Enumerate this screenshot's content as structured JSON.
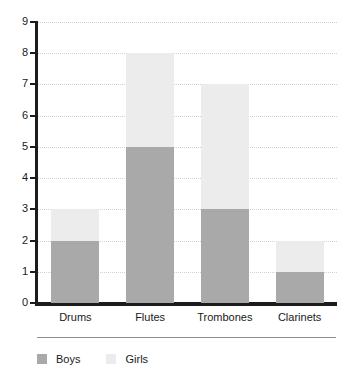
{
  "chart_data": {
    "type": "bar",
    "subtype": "stacked-vertical",
    "title": "",
    "xlabel": "",
    "ylabel": "",
    "categories": [
      "Drums",
      "Flutes",
      "Trombones",
      "Clarinets"
    ],
    "series": [
      {
        "name": "Boys",
        "values": [
          2,
          5,
          3,
          1
        ],
        "color": "#a9a9a9"
      },
      {
        "name": "Girls",
        "values": [
          1,
          3,
          4,
          1
        ],
        "color": "#ececec"
      }
    ],
    "totals": [
      3,
      8,
      7,
      2
    ],
    "ylim": [
      0,
      9
    ],
    "ytick_step": 1,
    "yticks": [
      0,
      1,
      2,
      3,
      4,
      5,
      6,
      7,
      8,
      9
    ],
    "ytick_labels": [
      "0",
      "1",
      "2",
      "3",
      "4",
      "5",
      "6",
      "7",
      "8",
      "9"
    ],
    "grid": true,
    "grid_axis": "y",
    "grid_style": "dotted",
    "grid_color": "#d2d2d2",
    "legend": true,
    "legend_position": "bottom-left",
    "axis_color": "#1c1c1c",
    "background": "#ffffff"
  },
  "legend_entries": [
    {
      "label": "Boys",
      "color": "#a9a9a9"
    },
    {
      "label": "Girls",
      "color": "#ececec"
    }
  ]
}
